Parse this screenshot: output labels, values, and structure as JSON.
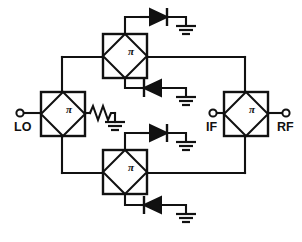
{
  "diagram": {
    "type": "circuit-schematic",
    "background_color": "#ffffff",
    "line_color": "#111111",
    "width": 302,
    "height": 242
  },
  "ports": [
    {
      "id": "lo",
      "label": "LO",
      "x": 20,
      "y": 113,
      "label_x": 14,
      "label_y": 130
    },
    {
      "id": "if",
      "label": "IF",
      "x": 213,
      "y": 113,
      "label_x": 206,
      "label_y": 130
    },
    {
      "id": "rf",
      "label": "RF",
      "x": 286,
      "y": 113,
      "label_x": 278,
      "label_y": 130
    }
  ],
  "couplers": [
    {
      "id": "coupler-lo",
      "label": "π",
      "x": 41,
      "y": 92,
      "size": 44,
      "label_x": 66,
      "label_y": 113
    },
    {
      "id": "coupler-top",
      "label": "π",
      "x": 103,
      "y": 34,
      "size": 44,
      "label_x": 128,
      "label_y": 55
    },
    {
      "id": "coupler-bot",
      "label": "π",
      "x": 103,
      "y": 150,
      "size": 44,
      "label_x": 128,
      "label_y": 171
    },
    {
      "id": "coupler-rf",
      "label": "π",
      "x": 224,
      "y": 92,
      "size": 44,
      "label_x": 249,
      "label_y": 113
    }
  ],
  "diodes": [
    {
      "id": "diode-top-upper",
      "direction": "right",
      "x": 141,
      "y": 17
    },
    {
      "id": "diode-top-lower",
      "direction": "left",
      "x": 141,
      "y": 88
    },
    {
      "id": "diode-bottom-upper",
      "direction": "right",
      "x": 141,
      "y": 133
    },
    {
      "id": "diode-bottom-lower",
      "direction": "left",
      "x": 141,
      "y": 205
    }
  ],
  "grounds": [
    {
      "id": "ground-resistor",
      "x": 115,
      "y": 122
    },
    {
      "id": "ground-top-upper",
      "x": 186,
      "y": 26
    },
    {
      "id": "ground-top-lower",
      "x": 186,
      "y": 97
    },
    {
      "id": "ground-bottom-upper",
      "x": 186,
      "y": 142
    },
    {
      "id": "ground-bottom-lower",
      "x": 186,
      "y": 214
    }
  ],
  "resistor": {
    "id": "termination-resistor",
    "x1": 86,
    "y1": 113,
    "x2": 115,
    "y2": 113
  },
  "buses": {
    "top_bus_y": 57,
    "bottom_bus_y": 173,
    "left_rail_x": 62,
    "right_rail_x": 245
  }
}
